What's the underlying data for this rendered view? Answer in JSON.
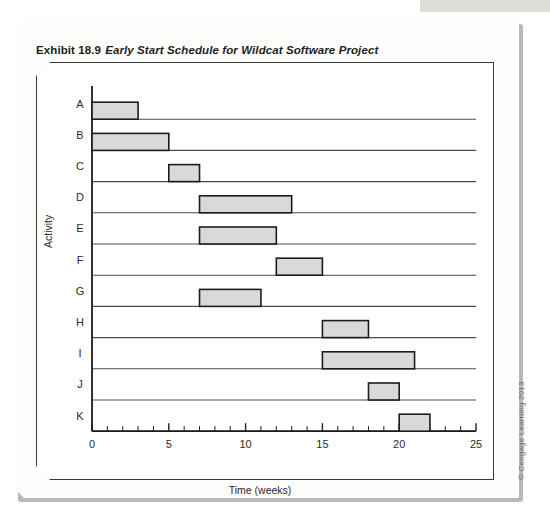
{
  "exhibit": {
    "label": "Exhibit 18.9",
    "title": "Early Start Schedule for Wildcat Software Project"
  },
  "copyright": "© Cengage Learning 2013",
  "colors": {
    "bar_fill": "#d9d9d9",
    "bar_stroke": "#1c1c1c",
    "axis": "#1c1c1c",
    "row_line": "#4a4a4a",
    "text": "#2b2b2b",
    "card": "#fdfdfb",
    "shadow": "#b9b9b7"
  },
  "chart_data": {
    "type": "bar",
    "orientation": "horizontal",
    "title": "Early Start Schedule for Wildcat Software Project",
    "xlabel": "Time (weeks)",
    "ylabel": "Activity",
    "xlim": [
      0,
      25
    ],
    "ylim_categories": [
      "A",
      "B",
      "C",
      "D",
      "E",
      "F",
      "G",
      "H",
      "I",
      "J",
      "K"
    ],
    "x_major_ticks": [
      0,
      5,
      10,
      15,
      20,
      25
    ],
    "x_minor_tick_step": 1,
    "x_tick_labels": [
      "0",
      "5",
      "10",
      "15",
      "20",
      "25"
    ],
    "grid": false,
    "legend": null,
    "categories": [
      "A",
      "B",
      "C",
      "D",
      "E",
      "F",
      "G",
      "H",
      "I",
      "J",
      "K"
    ],
    "bars": [
      {
        "activity": "A",
        "start": 0,
        "finish": 3,
        "duration": 3
      },
      {
        "activity": "B",
        "start": 0,
        "finish": 5,
        "duration": 5
      },
      {
        "activity": "C",
        "start": 5,
        "finish": 7,
        "duration": 2
      },
      {
        "activity": "D",
        "start": 7,
        "finish": 13,
        "duration": 6
      },
      {
        "activity": "E",
        "start": 7,
        "finish": 12,
        "duration": 5
      },
      {
        "activity": "F",
        "start": 12,
        "finish": 15,
        "duration": 3
      },
      {
        "activity": "G",
        "start": 7,
        "finish": 11,
        "duration": 4
      },
      {
        "activity": "H",
        "start": 15,
        "finish": 18,
        "duration": 3
      },
      {
        "activity": "I",
        "start": 15,
        "finish": 21,
        "duration": 6
      },
      {
        "activity": "J",
        "start": 18,
        "finish": 20,
        "duration": 2
      },
      {
        "activity": "K",
        "start": 20,
        "finish": 22,
        "duration": 2
      }
    ]
  }
}
